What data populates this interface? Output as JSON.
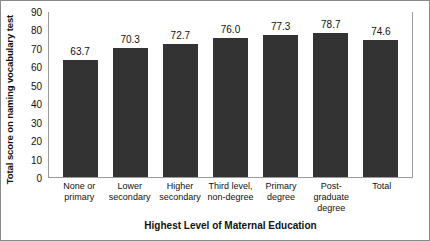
{
  "chart_data": {
    "type": "bar",
    "title": "",
    "xlabel": "Highest Level of Maternal Education",
    "ylabel": "Total score on naming vocabulary test",
    "categories": [
      "None or primary",
      "Lower secondary",
      "Higher secondary",
      "Third level, non-degree",
      "Primary degree",
      "Post-graduate degree",
      "Total"
    ],
    "category_lines": [
      [
        "None or",
        "primary"
      ],
      [
        "Lower",
        "secondary"
      ],
      [
        "Higher",
        "secondary"
      ],
      [
        "Third level,",
        "non-degree"
      ],
      [
        "Primary",
        "degree"
      ],
      [
        "Post-",
        "graduate",
        "degree"
      ],
      [
        "Total"
      ]
    ],
    "values": [
      63.7,
      70.3,
      72.7,
      76.0,
      77.3,
      78.7,
      74.6
    ],
    "value_labels": [
      "63.7",
      "70.3",
      "72.7",
      "76.0",
      "77.3",
      "78.7",
      "74.6"
    ],
    "ylim": [
      0,
      90
    ],
    "ytick_values": [
      0,
      10,
      20,
      30,
      40,
      50,
      60,
      70,
      80,
      90
    ],
    "ytick_labels": [
      "0",
      "10",
      "20",
      "30",
      "40",
      "50",
      "60",
      "70",
      "80",
      "90"
    ],
    "grid": false,
    "legend": false,
    "legend_position": "none",
    "bar_color": "#333333",
    "axis_color": "#9a9a9a",
    "text_color": "#111111",
    "background_color": "#ffffff",
    "frame_color": "#8a8a8a"
  }
}
